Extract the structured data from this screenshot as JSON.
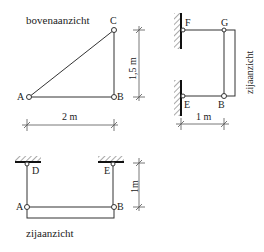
{
  "views": {
    "top_view": {
      "title": "bovenaanzicht",
      "points": {
        "A": "A",
        "B": "B",
        "C": "C"
      },
      "dim_horizontal": "2 m",
      "dim_vertical": "1,5 m"
    },
    "side_view_right": {
      "title": "zijaanzicht",
      "points": {
        "F": "F",
        "G": "G",
        "E": "E",
        "B": "B"
      },
      "dim_horizontal": "1 m"
    },
    "side_view_bottom": {
      "title": "zijaanzicht",
      "points": {
        "D": "D",
        "E": "E",
        "A": "A",
        "B": "B"
      },
      "dim_vertical": "1m"
    }
  },
  "colors": {
    "line": "#333333",
    "background": "#ffffff"
  }
}
